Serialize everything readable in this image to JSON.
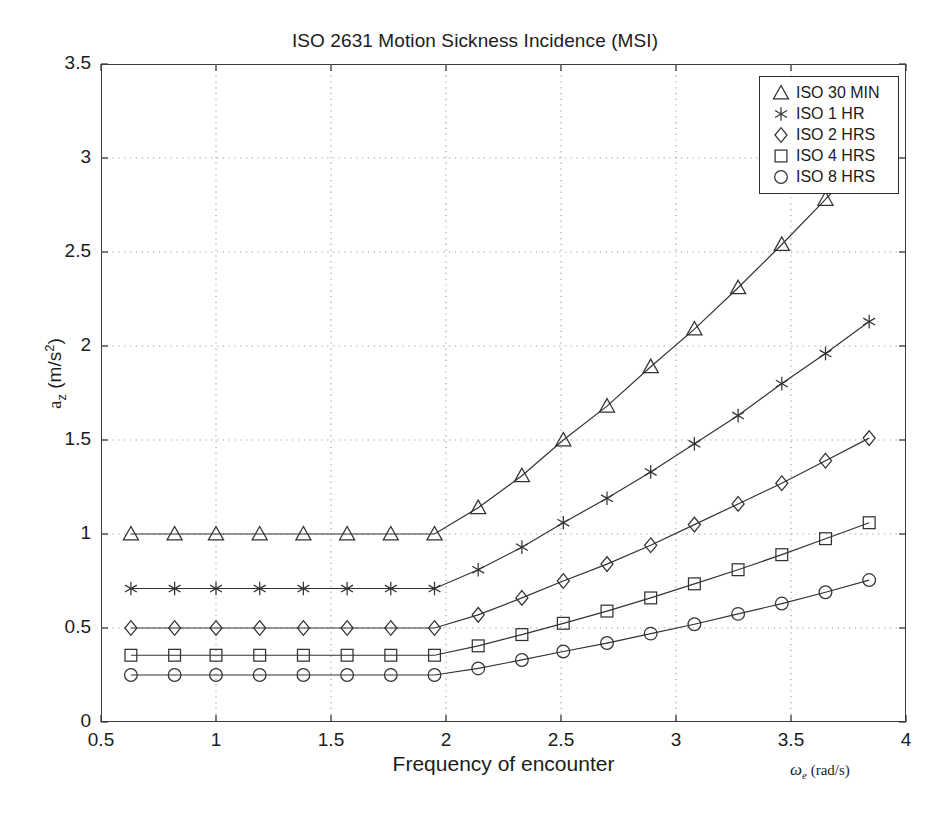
{
  "chart_data": {
    "type": "line",
    "title": "ISO 2631 Motion Sickness Incidence (MSI)",
    "xlabel": "Frequency of encounter",
    "xunit": "ω_e (rad/s)",
    "ylabel": "a_z (m/s^2)",
    "xlim": [
      0.5,
      4
    ],
    "ylim": [
      0,
      3.5
    ],
    "xticks": [
      "0.5",
      "1",
      "1.5",
      "2",
      "2.5",
      "3",
      "3.5",
      "4"
    ],
    "xtick_values": [
      0.5,
      1,
      1.5,
      2,
      2.5,
      3,
      3.5,
      4
    ],
    "yticks": [
      "0",
      "0.5",
      "1",
      "1.5",
      "2",
      "2.5",
      "3",
      "3.5"
    ],
    "ytick_values": [
      0,
      0.5,
      1,
      1.5,
      2,
      2.5,
      3,
      3.5
    ],
    "grid": true,
    "grid_style": "dotted",
    "legend_position": "top-right",
    "line_color": "#333333",
    "grid_color": "#9a9a9a",
    "x": [
      0.63,
      0.82,
      1.0,
      1.19,
      1.38,
      1.57,
      1.76,
      1.95,
      2.14,
      2.33,
      2.51,
      2.7,
      2.89,
      3.08,
      3.27,
      3.46,
      3.65,
      3.84
    ],
    "series": [
      {
        "name": "ISO 30 MIN",
        "marker": "triangle",
        "values": [
          1.0,
          1.0,
          1.0,
          1.0,
          1.0,
          1.0,
          1.0,
          1.0,
          1.14,
          1.31,
          1.5,
          1.68,
          1.89,
          2.09,
          2.31,
          2.54,
          2.78,
          3.02
        ]
      },
      {
        "name": "ISO 1 HR",
        "marker": "asterisk",
        "values": [
          0.71,
          0.71,
          0.71,
          0.71,
          0.71,
          0.71,
          0.71,
          0.71,
          0.81,
          0.93,
          1.06,
          1.19,
          1.33,
          1.48,
          1.63,
          1.8,
          1.96,
          2.13
        ]
      },
      {
        "name": "ISO 2 HRS",
        "marker": "diamond",
        "values": [
          0.5,
          0.5,
          0.5,
          0.5,
          0.5,
          0.5,
          0.5,
          0.5,
          0.57,
          0.66,
          0.75,
          0.84,
          0.94,
          1.05,
          1.16,
          1.27,
          1.39,
          1.51
        ]
      },
      {
        "name": "ISO 4 HRS",
        "marker": "square",
        "values": [
          0.355,
          0.355,
          0.355,
          0.355,
          0.355,
          0.355,
          0.355,
          0.355,
          0.405,
          0.465,
          0.525,
          0.59,
          0.66,
          0.735,
          0.81,
          0.89,
          0.975,
          1.06
        ]
      },
      {
        "name": "ISO 8 HRS",
        "marker": "circle",
        "values": [
          0.25,
          0.25,
          0.25,
          0.25,
          0.25,
          0.25,
          0.25,
          0.25,
          0.285,
          0.33,
          0.375,
          0.42,
          0.47,
          0.52,
          0.575,
          0.63,
          0.69,
          0.755
        ]
      }
    ]
  },
  "legend": {
    "entries": [
      {
        "label": "ISO 30 MIN",
        "marker": "triangle"
      },
      {
        "label": "ISO 1 HR",
        "marker": "asterisk"
      },
      {
        "label": "ISO 2 HRS",
        "marker": "diamond"
      },
      {
        "label": "ISO 4 HRS",
        "marker": "square"
      },
      {
        "label": "ISO 8 HRS",
        "marker": "circle"
      }
    ]
  },
  "axis": {
    "ylabel_main": "a",
    "ylabel_sub": "z",
    "ylabel_unit": " (m/s",
    "ylabel_sup": "2",
    "ylabel_close": ")",
    "xunit_symbol": "ω",
    "xunit_sub": "e",
    "xunit_rest": " (rad/s)"
  }
}
